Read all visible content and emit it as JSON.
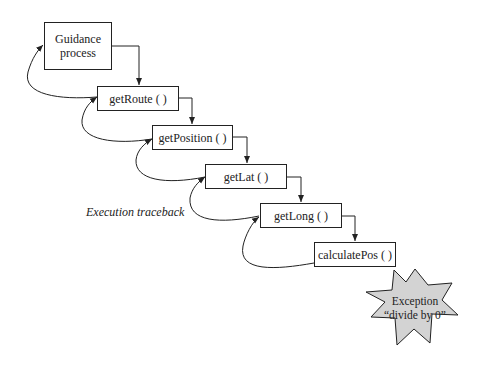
{
  "diagram": {
    "nodes": [
      {
        "id": "guidance",
        "label": "Guidance process",
        "line1": "Guidance",
        "line2": "process"
      },
      {
        "id": "getRoute",
        "label": "getRoute ( )"
      },
      {
        "id": "getPosition",
        "label": "getPosition ( )"
      },
      {
        "id": "getLat",
        "label": "getLat ( )"
      },
      {
        "id": "getLong",
        "label": "getLong ( )"
      },
      {
        "id": "calculatePos",
        "label": "calculatePos ( )"
      }
    ],
    "annotation": "Execution traceback",
    "exception": {
      "line1": "Exception",
      "line2": "“divide by 0”",
      "fill": "#d3d3d3"
    },
    "edges": [
      {
        "from": "guidance",
        "to": "getRoute",
        "type": "call"
      },
      {
        "from": "getRoute",
        "to": "getPosition",
        "type": "call"
      },
      {
        "from": "getPosition",
        "to": "getLat",
        "type": "call"
      },
      {
        "from": "getLat",
        "to": "getLong",
        "type": "call"
      },
      {
        "from": "getLong",
        "to": "calculatePos",
        "type": "call"
      },
      {
        "from": "calculatePos",
        "to": "getLong",
        "type": "traceback"
      },
      {
        "from": "getLong",
        "to": "getLat",
        "type": "traceback"
      },
      {
        "from": "getLat",
        "to": "getPosition",
        "type": "traceback"
      },
      {
        "from": "getPosition",
        "to": "getRoute",
        "type": "traceback"
      },
      {
        "from": "getRoute",
        "to": "guidance",
        "type": "traceback"
      }
    ]
  }
}
